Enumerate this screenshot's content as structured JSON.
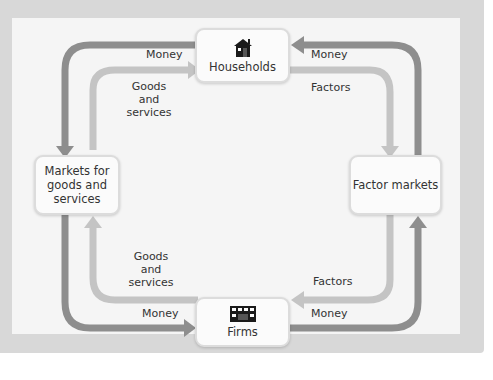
{
  "diagram": {
    "type": "circular-flow",
    "colors": {
      "frame": "#d8d8d8",
      "panel": "#f5f5f5",
      "money_flow": "#8e8e8e",
      "goods_factors_flow": "#c4c4c4",
      "text": "#333333"
    },
    "nodes": {
      "households": {
        "label": "Households",
        "icon": "house-icon"
      },
      "firms": {
        "label": "Firms",
        "icon": "factory-building-icon"
      },
      "goods_markets": {
        "label": "Markets for\ngoods and\nservices"
      },
      "factor_markets": {
        "label": "Factor markets"
      }
    },
    "flows": {
      "top_left_money": "Money",
      "top_left_goods": "Goods\nand\nservices",
      "top_right_money": "Money",
      "top_right_factors": "Factors",
      "bottom_left_goods": "Goods\nand\nservices",
      "bottom_left_money": "Money",
      "bottom_right_factors": "Factors",
      "bottom_right_money": "Money"
    }
  }
}
